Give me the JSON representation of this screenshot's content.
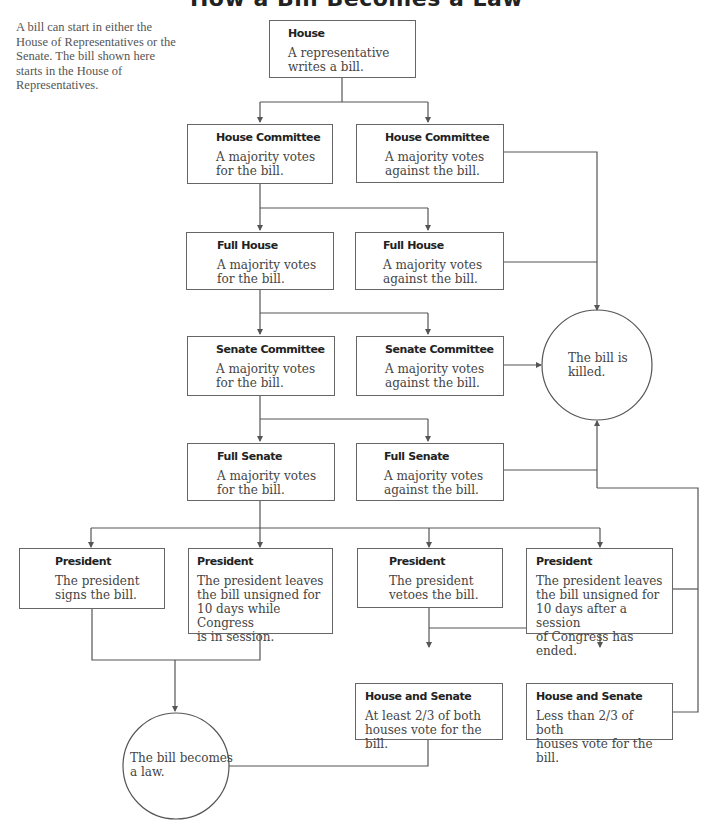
{
  "title": "How a Bill Becomes a Law",
  "intro": "A bill can start in either the House of Representatives or the Senate. The bill shown here starts in the House of Representatives.",
  "line_color": "#555555",
  "nodes": {
    "house": {
      "heading": "House",
      "body": "A representative\nwrites a bill."
    },
    "house_committee_for": {
      "heading": "House Committee",
      "body": "A majority votes\nfor the bill."
    },
    "house_committee_against": {
      "heading": "House Committee",
      "body": "A majority votes\nagainst the bill."
    },
    "full_house_for": {
      "heading": "Full House",
      "body": "A majority votes\nfor the bill."
    },
    "full_house_against": {
      "heading": "Full House",
      "body": "A majority votes\nagainst the bill."
    },
    "senate_committee_for": {
      "heading": "Senate Committee",
      "body": "A majority votes\nfor the bill."
    },
    "senate_committee_against": {
      "heading": "Senate Committee",
      "body": "A majority votes\nagainst the bill."
    },
    "full_senate_for": {
      "heading": "Full Senate",
      "body": "A majority votes\nfor the bill."
    },
    "full_senate_against": {
      "heading": "Full Senate",
      "body": "A majority votes\nagainst the bill."
    },
    "president_signs": {
      "heading": "President",
      "body": "The president\nsigns the bill."
    },
    "president_unsigned_in_session": {
      "heading": "President",
      "body": "The president leaves\nthe bill unsigned for\n10 days while Congress\nis in session."
    },
    "president_vetoes": {
      "heading": "President",
      "body": "The president\nvetoes the bill."
    },
    "president_unsigned_after_session": {
      "heading": "President",
      "body": "The president leaves\nthe bill unsigned for\n10 days after a session\nof Congress has ended."
    },
    "override_success": {
      "heading": "House and Senate",
      "body": "At least 2/3 of both\nhouses vote for the bill."
    },
    "override_fail": {
      "heading": "House and Senate",
      "body": "Less than 2/3 of both\nhouses vote for the bill."
    }
  },
  "outcomes": {
    "killed": "The bill is\nkilled.",
    "law": "The bill becomes\na law."
  }
}
